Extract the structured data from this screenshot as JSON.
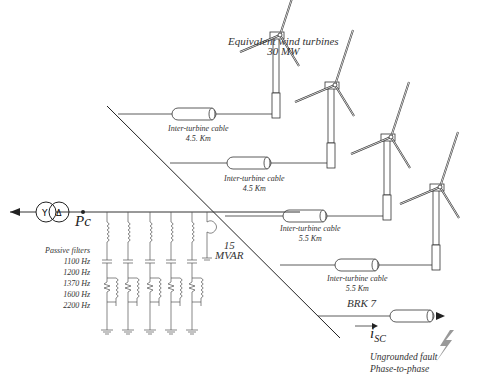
{
  "title": "Equivalent wind turbines",
  "rating": "30 MW",
  "bus_label": "Pc",
  "capacitor": {
    "value": "15",
    "unit": "MVAR"
  },
  "filters": {
    "title": "Passive filters",
    "frequencies": [
      "1100 Hz",
      "1200 Hz",
      "1370 Hz",
      "1600 Hz",
      "2200 Hz"
    ]
  },
  "cables": [
    {
      "label": "Inter-turbine cable",
      "length": "4.5. Km"
    },
    {
      "label": "Inter-turbine cable",
      "length": "4.5 Km"
    },
    {
      "label": "Inter-turbine cable",
      "length": "5.5 Km"
    },
    {
      "label": "Inter-turbine cable",
      "length": "5.5 Km"
    }
  ],
  "breaker": "BRK 7",
  "current": "i",
  "current_sub": "SC",
  "fault": {
    "line1": "Ungrounded fault",
    "line2": "Phase-to-phase"
  },
  "transformer": {
    "primary": "Y",
    "secondary": "Δ"
  }
}
